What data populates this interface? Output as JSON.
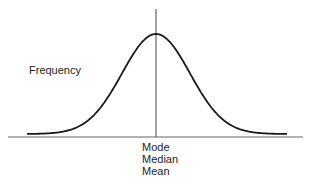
{
  "chart_data": {
    "type": "line",
    "title": "",
    "subtitle": "",
    "xlabel": "",
    "ylabel": "Frequency",
    "grid": false,
    "legend": null,
    "center_label_lines": [
      "Mode",
      "Median",
      "Mean"
    ],
    "x": [
      -4,
      -3,
      -2,
      -1,
      0,
      1,
      2,
      3,
      4
    ],
    "series": [
      {
        "name": "Normal distribution",
        "values": [
          0.0001,
          0.0044,
          0.054,
          0.242,
          0.399,
          0.242,
          0.054,
          0.0044,
          0.0001
        ]
      }
    ],
    "xlim": [
      -4.3,
      4.3
    ],
    "ylim": [
      0,
      0.4
    ],
    "annotations": [
      {
        "type": "vline",
        "x": 0,
        "label": "Mode / Median / Mean"
      }
    ]
  },
  "labels": {
    "y_axis": "Frequency",
    "center": [
      "Mode",
      "Median",
      "Mean"
    ]
  },
  "colors": {
    "curve": "#1a1a1a",
    "axis": "#666666",
    "text": "#222222"
  },
  "layout": {
    "axis": {
      "x1": 8,
      "x2": 303,
      "y": 137
    },
    "vline": {
      "x": 156,
      "y1": 9,
      "y2": 137
    },
    "curve": {
      "x_start": 27,
      "x_end": 287,
      "center_x": 156,
      "baseline_y": 134,
      "peak_y": 34,
      "sigma_px": 34
    }
  }
}
